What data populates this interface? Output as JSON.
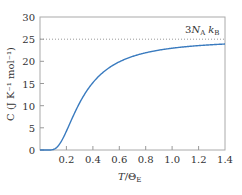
{
  "chart_data": {
    "type": "line",
    "title": "",
    "xlabel": "T/Θ_E",
    "ylabel": "C (J K^-1 mol^-1)",
    "xlim": [
      0,
      1.4
    ],
    "ylim": [
      0,
      30
    ],
    "x_ticks": [
      "0.2",
      "0.4",
      "0.6",
      "0.8",
      "1.0",
      "1.2",
      "1.4"
    ],
    "y_ticks": [
      "0",
      "5",
      "10",
      "15",
      "20",
      "25",
      "30"
    ],
    "grid": false,
    "legend": null,
    "annotations": [
      {
        "text": "3N_A k_B",
        "y": 24.94,
        "style": "dotted horizontal line"
      }
    ],
    "series": [
      {
        "name": "Einstein heat capacity",
        "color": "#3a7bbf",
        "x": [
          0.0,
          0.05,
          0.1,
          0.15,
          0.2,
          0.25,
          0.3,
          0.35,
          0.4,
          0.5,
          0.6,
          0.7,
          0.8,
          0.9,
          1.0,
          1.1,
          1.2,
          1.3,
          1.4
        ],
        "values": [
          0.0,
          0.0,
          0.11,
          1.2,
          3.4,
          6.2,
          8.9,
          11.3,
          13.3,
          16.3,
          18.3,
          19.7,
          20.7,
          21.5,
          22.1,
          22.6,
          22.9,
          23.2,
          23.4
        ]
      }
    ]
  },
  "labels": {
    "ylabel_text": "C (J K⁻¹ mol⁻¹)",
    "xlabel_T": "T",
    "xlabel_slash": "/",
    "xlabel_theta": "Θ",
    "xlabel_sub": "E",
    "annot_3": "3",
    "annot_N": "N",
    "annot_A": "A",
    "annot_k": "k",
    "annot_B": "B"
  }
}
